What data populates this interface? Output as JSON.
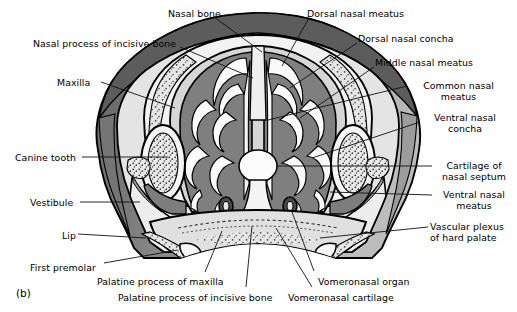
{
  "figure": {
    "caption": "(b)",
    "kind": "anatomical-cross-section",
    "palette": {
      "background": "#ffffff",
      "outline": "#000000",
      "skin_dark_gray": "#6f6f6f",
      "skin_mid_gray": "#8d8d8d",
      "soft_tissue_gray": "#8a8a8a",
      "mucosa_light": "#d9d9d9",
      "bone_pale": "#ececec",
      "cavity_white": "#fafafa",
      "stipple": "#4a4a4a",
      "leader_line": "#111111",
      "label_text": "#000000"
    }
  },
  "labels": [
    {
      "id": "nasal-bone",
      "text": "Nasal bone",
      "side": "top-left",
      "x": 168,
      "y": 8,
      "align": "left"
    },
    {
      "id": "nasal-process-incisive-bone",
      "text": "Nasal process of incisive bone",
      "side": "left",
      "x": 33,
      "y": 38,
      "align": "left"
    },
    {
      "id": "maxilla",
      "text": "Maxilla",
      "side": "left",
      "x": 57,
      "y": 77,
      "align": "left"
    },
    {
      "id": "canine-tooth",
      "text": "Canine tooth",
      "side": "left",
      "x": 15,
      "y": 152,
      "align": "left"
    },
    {
      "id": "vestibule",
      "text": "Vestibule",
      "side": "left",
      "x": 30,
      "y": 197,
      "align": "left"
    },
    {
      "id": "lip",
      "text": "Lip",
      "side": "left",
      "x": 62,
      "y": 230,
      "align": "left"
    },
    {
      "id": "first-premolar",
      "text": "First premolar",
      "side": "bottom-left",
      "x": 30,
      "y": 262,
      "align": "left"
    },
    {
      "id": "palatine-process-maxilla",
      "text": "Palatine process of maxilla",
      "side": "bottom",
      "x": 97,
      "y": 276,
      "align": "left"
    },
    {
      "id": "palatine-process-incisive",
      "text": "Palatine process of incisive bone",
      "side": "bottom",
      "x": 118,
      "y": 292,
      "align": "left"
    },
    {
      "id": "vomeronasal-cartilage",
      "text": "Vomeronasal cartilage",
      "side": "bottom",
      "x": 288,
      "y": 292,
      "align": "left"
    },
    {
      "id": "vomeronasal-organ",
      "text": "Vomeronasal organ",
      "side": "bottom-right",
      "x": 318,
      "y": 276,
      "align": "left"
    },
    {
      "id": "dorsal-nasal-meatus",
      "text": "Dorsal nasal meatus",
      "side": "top-right",
      "x": 307,
      "y": 8,
      "align": "left"
    },
    {
      "id": "dorsal-nasal-concha",
      "text": "Dorsal nasal concha",
      "side": "top-right",
      "x": 358,
      "y": 33,
      "align": "left"
    },
    {
      "id": "middle-nasal-meatus",
      "text": "Middle nasal meatus",
      "side": "top-right",
      "x": 375,
      "y": 57,
      "align": "left"
    },
    {
      "id": "common-nasal-meatus",
      "text": "Common nasal meatus",
      "side": "right",
      "x": 409,
      "y": 80,
      "align": "left",
      "wrap": 95
    },
    {
      "id": "ventral-nasal-concha",
      "text": "Ventral nasal concha",
      "side": "right",
      "x": 422,
      "y": 112,
      "align": "left",
      "wrap": 84
    },
    {
      "id": "cartilage-nasal-septum",
      "text": "Cartilage of nasal septum",
      "side": "right",
      "x": 434,
      "y": 160,
      "align": "left",
      "wrap": 78
    },
    {
      "id": "ventral-nasal-meatus",
      "text": "Ventral nasal meatus",
      "side": "right",
      "x": 434,
      "y": 189,
      "align": "left",
      "wrap": 78
    },
    {
      "id": "vascular-plexus-hard-palate",
      "text": "Vascular plexus of hard palate",
      "side": "right",
      "x": 430,
      "y": 221,
      "align": "left",
      "wrap": 86
    }
  ],
  "structures": [
    {
      "id": "skin-muzzle",
      "name": "Skin and subcutis of muzzle",
      "tone": "skin_dark_gray"
    },
    {
      "id": "nasal-bone-shell",
      "name": "Nasal bone",
      "tone": "bone_pale"
    },
    {
      "id": "dorsal-concha",
      "name": "Dorsal nasal concha",
      "tone": "soft_tissue_gray"
    },
    {
      "id": "ventral-concha",
      "name": "Ventral nasal concha",
      "tone": "soft_tissue_gray"
    },
    {
      "id": "nasal-septum",
      "name": "Cartilage of nasal septum",
      "tone": "cavity_white"
    },
    {
      "id": "canine-root",
      "name": "Canine tooth root",
      "tone": "bone_pale"
    },
    {
      "id": "hard-palate",
      "name": "Hard palate",
      "tone": "mucosa_light"
    },
    {
      "id": "vomeronasal-organ-pair",
      "name": "Vomeronasal organ",
      "tone": "stipple"
    }
  ]
}
